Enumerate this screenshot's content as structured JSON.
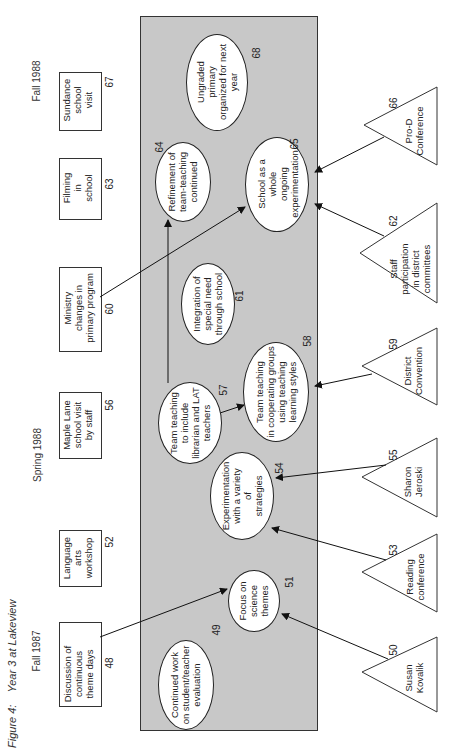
{
  "figure": {
    "label": "Figure 4:",
    "title": "Year 3 at Lakeview"
  },
  "seasons": {
    "fall1987": "Fall 1987",
    "spring1988": "Spring 1988",
    "fall1988": "Fall 1988"
  },
  "colors": {
    "panel": "#c8c8c8",
    "line": "#222222",
    "node_fill": "#ffffff"
  },
  "boxes": [
    {
      "id": "48",
      "num": "48",
      "lines": [
        "Discussion of",
        "continuous",
        "theme days"
      ]
    },
    {
      "id": "52",
      "num": "52",
      "lines": [
        "Language",
        "arts",
        "workshop"
      ]
    },
    {
      "id": "56",
      "num": "56",
      "lines": [
        "Maple Lane",
        "school visit",
        "by staff"
      ]
    },
    {
      "id": "60",
      "num": "60",
      "lines": [
        "Ministry",
        "changes in",
        "primary program"
      ]
    },
    {
      "id": "63",
      "num": "63",
      "lines": [
        "Filming",
        "in",
        "school"
      ]
    },
    {
      "id": "67",
      "num": "67",
      "lines": [
        "Sundance",
        "school",
        "visit"
      ]
    }
  ],
  "ellipses": [
    {
      "id": "49",
      "num": "49",
      "lines": [
        "Continued work",
        "on student/teacher",
        "evaluation"
      ]
    },
    {
      "id": "51",
      "num": "51",
      "lines": [
        "Focus on",
        "science",
        "themes"
      ]
    },
    {
      "id": "54",
      "num": "54",
      "lines": [
        "Experimentation",
        "with a variety",
        "of",
        "strategies"
      ]
    },
    {
      "id": "57",
      "num": "57",
      "lines": [
        "Team teaching",
        "to include",
        "librarian and LAT",
        "teachers"
      ]
    },
    {
      "id": "58",
      "num": "58",
      "lines": [
        "Team teaching",
        "in cooperating groups",
        "using teaching",
        "learning styles"
      ]
    },
    {
      "id": "61",
      "num": "61",
      "lines": [
        "Integration of",
        "special need",
        "through school"
      ]
    },
    {
      "id": "64",
      "num": "64",
      "lines": [
        "Refinement of",
        "team-teaching",
        "continued"
      ]
    },
    {
      "id": "65",
      "num": "65",
      "lines": [
        "School as a",
        "whole",
        "ongoing",
        "experimentation"
      ]
    },
    {
      "id": "68",
      "num": "68",
      "lines": [
        "Ungraded",
        "primary",
        "organized for next",
        "year"
      ]
    }
  ],
  "triangles": [
    {
      "id": "50",
      "num": "50",
      "lines": [
        "Susan",
        "Kovalik"
      ]
    },
    {
      "id": "53",
      "num": "53",
      "lines": [
        "Reading",
        "conference"
      ]
    },
    {
      "id": "55",
      "num": "55",
      "lines": [
        "Sharon",
        "Jeroski"
      ]
    },
    {
      "id": "59",
      "num": "59",
      "lines": [
        "District",
        "Convention"
      ]
    },
    {
      "id": "62",
      "num": "62",
      "lines": [
        "Staff",
        "participation",
        "in district",
        "committees"
      ]
    },
    {
      "id": "66",
      "num": "66",
      "lines": [
        "Pro-D",
        "Conference"
      ]
    }
  ],
  "connections": [
    {
      "from": "48",
      "to": "51"
    },
    {
      "from": "50",
      "to": "51"
    },
    {
      "from": "53",
      "to": "54"
    },
    {
      "from": "55",
      "to": "54"
    },
    {
      "from": "57",
      "to": "58"
    },
    {
      "from": "59",
      "to": "58"
    },
    {
      "from": "57",
      "to": "64"
    },
    {
      "from": "60",
      "to": "65"
    },
    {
      "from": "62",
      "to": "65"
    },
    {
      "from": "66",
      "to": "65"
    }
  ]
}
